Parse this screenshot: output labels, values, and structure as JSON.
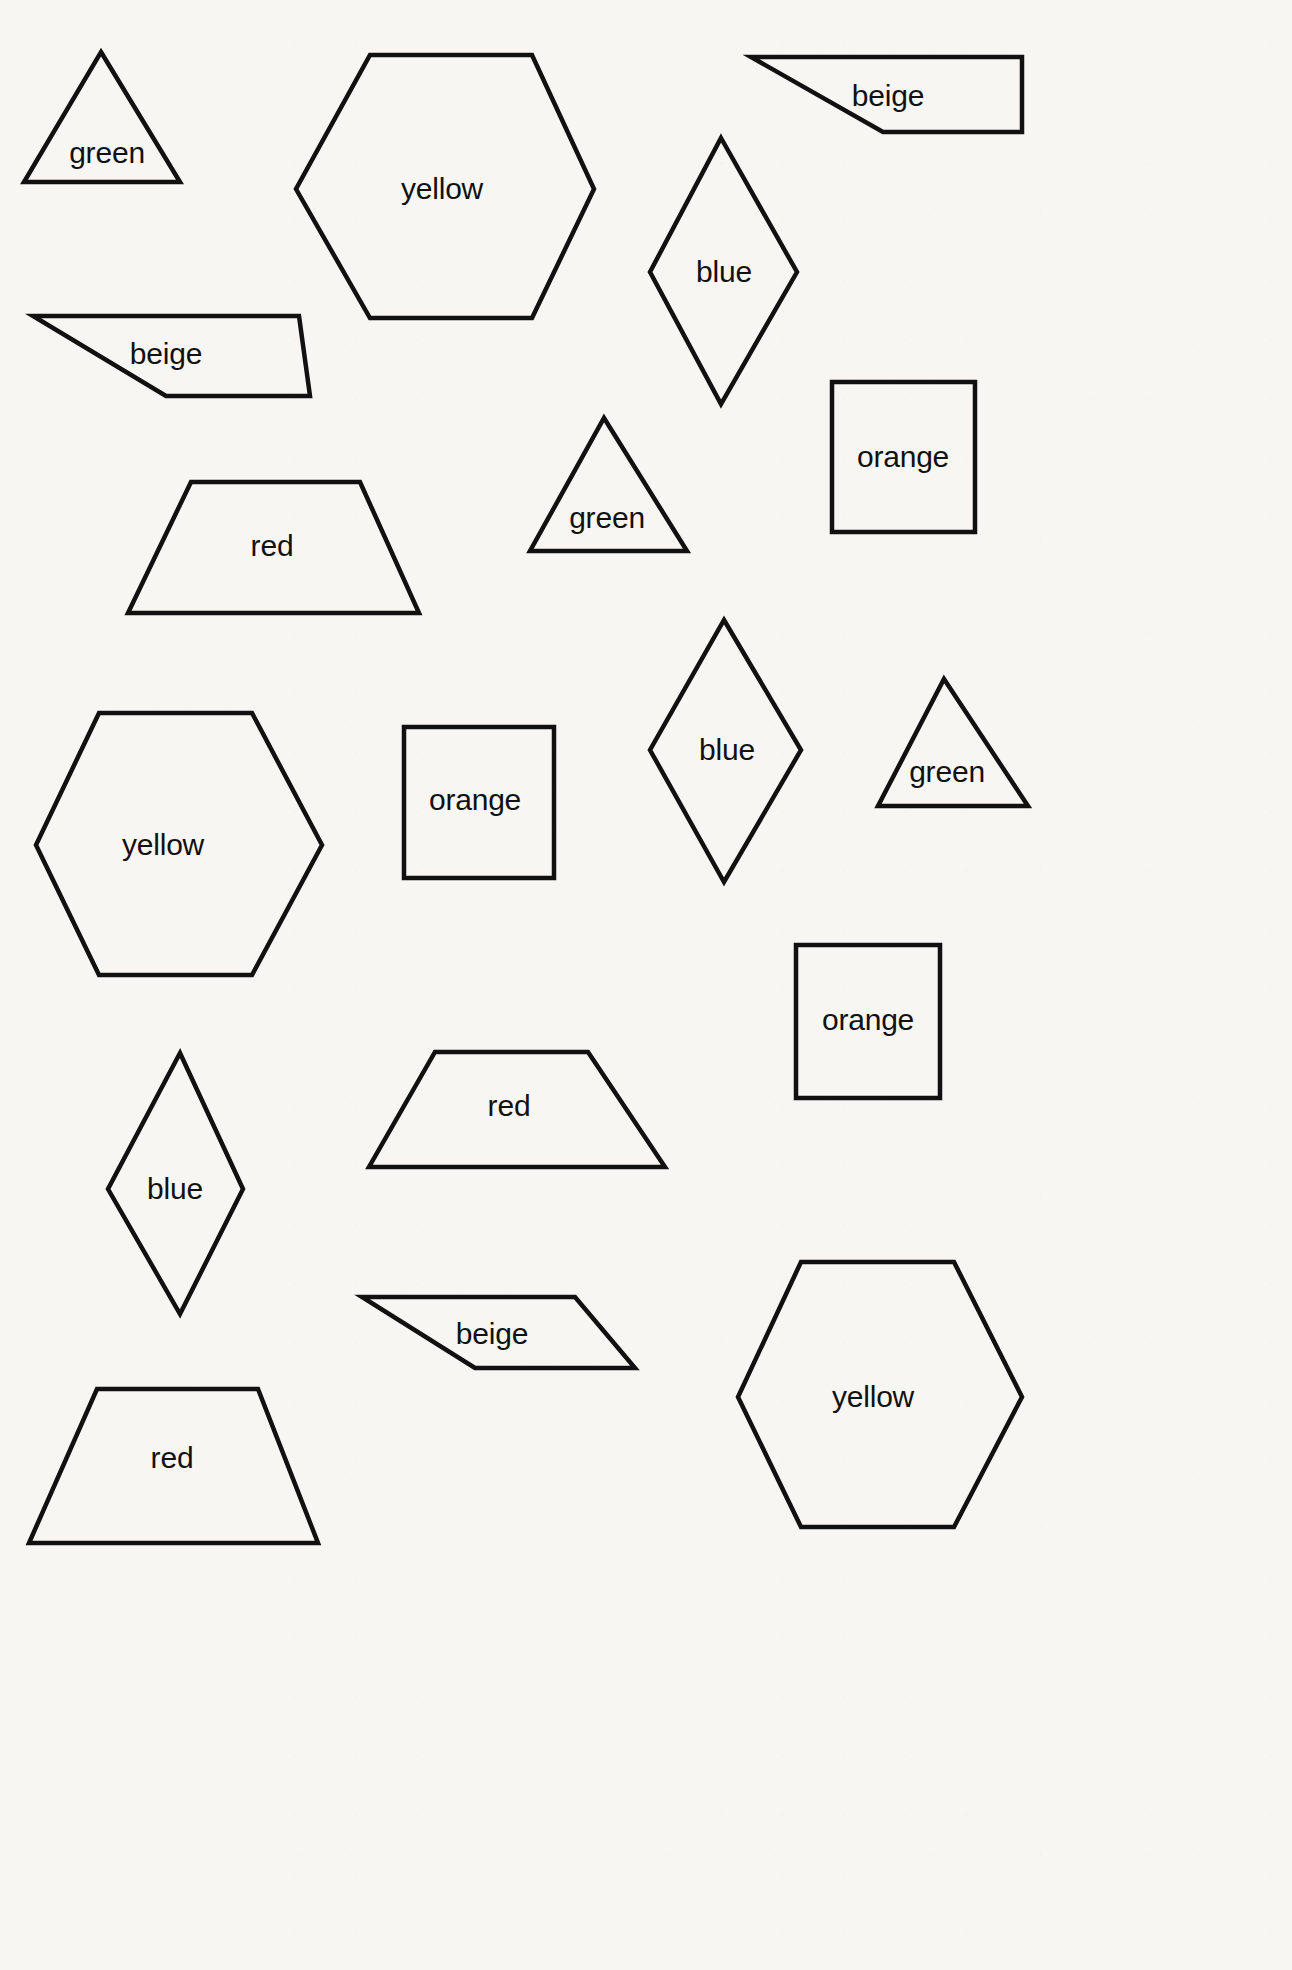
{
  "page": {
    "width": 1292,
    "height": 1970,
    "background_color": "#f7f6f3",
    "stroke_color": "#111111",
    "text_color": "#111111"
  },
  "shapes": [
    {
      "id": "triangle-green-1",
      "kind": "triangle",
      "label": "green",
      "label_x": 107,
      "label_y": 153,
      "points": "101,52 180,182 24,182"
    },
    {
      "id": "hexagon-yellow-1",
      "kind": "hexagon",
      "label": "yellow",
      "label_x": 442,
      "label_y": 189,
      "points": "370,55 532,55 594,189 532,318 370,318 296,189"
    },
    {
      "id": "parallelogram-beige-1",
      "kind": "parallelogram",
      "label": "beige",
      "label_x": 888,
      "label_y": 96,
      "points": "751,57 1022,57 1022,132 883,132"
    },
    {
      "id": "rhombus-blue-1",
      "kind": "rhombus",
      "label": "blue",
      "label_x": 724,
      "label_y": 272,
      "points": "721,138 797,272 721,404 650,272"
    },
    {
      "id": "parallelogram-beige-2",
      "kind": "parallelogram",
      "label": "beige",
      "label_x": 166,
      "label_y": 354,
      "points": "33,316 299,316 310,396 166,396"
    },
    {
      "id": "square-orange-1",
      "kind": "square",
      "label": "orange",
      "label_x": 903,
      "label_y": 457,
      "points": "832,382 975,382 975,532 832,532"
    },
    {
      "id": "trapezoid-red-1",
      "kind": "trapezoid",
      "label": "red",
      "label_x": 272,
      "label_y": 546,
      "points": "191,482 360,482 419,613 128,613"
    },
    {
      "id": "triangle-green-2",
      "kind": "triangle",
      "label": "green",
      "label_x": 607,
      "label_y": 518,
      "points": "604,418 687,551 530,551"
    },
    {
      "id": "hexagon-yellow-2",
      "kind": "hexagon",
      "label": "yellow",
      "label_x": 163,
      "label_y": 845,
      "points": "99,713 252,713 322,845 252,975 99,975 36,845"
    },
    {
      "id": "square-orange-2",
      "kind": "square",
      "label": "orange",
      "label_x": 475,
      "label_y": 800,
      "points": "404,727 554,727 554,878 404,878"
    },
    {
      "id": "rhombus-blue-2",
      "kind": "rhombus",
      "label": "blue",
      "label_x": 727,
      "label_y": 750,
      "points": "724,620 801,750 724,882 650,750"
    },
    {
      "id": "triangle-green-3",
      "kind": "triangle",
      "label": "green",
      "label_x": 947,
      "label_y": 772,
      "points": "944,679 1028,806 878,806"
    },
    {
      "id": "square-orange-3",
      "kind": "square",
      "label": "orange",
      "label_x": 868,
      "label_y": 1020,
      "points": "796,945 940,945 940,1098 796,1098"
    },
    {
      "id": "rhombus-blue-3",
      "kind": "rhombus",
      "label": "blue",
      "label_x": 175,
      "label_y": 1189,
      "points": "180,1053 243,1189 180,1314 108,1189"
    },
    {
      "id": "trapezoid-red-2",
      "kind": "trapezoid",
      "label": "red",
      "label_x": 509,
      "label_y": 1106,
      "points": "435,1052 588,1052 665,1167 369,1167"
    },
    {
      "id": "trapezoid-red-3",
      "kind": "trapezoid",
      "label": "red",
      "label_x": 172,
      "label_y": 1458,
      "points": "97,1389 258,1389 318,1543 29,1543"
    },
    {
      "id": "parallelogram-beige-3",
      "kind": "parallelogram",
      "label": "beige",
      "label_x": 492,
      "label_y": 1334,
      "points": "362,1297 575,1297 635,1368 475,1368"
    },
    {
      "id": "hexagon-yellow-3",
      "kind": "hexagon",
      "label": "yellow",
      "label_x": 873,
      "label_y": 1397,
      "points": "801,1262 954,1262 1022,1397 954,1527 801,1527 738,1397"
    }
  ]
}
